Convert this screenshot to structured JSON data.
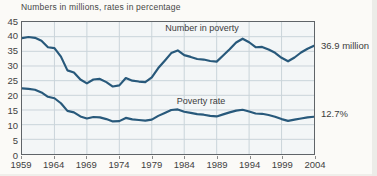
{
  "title": "Numbers in millions, rates in percentage",
  "annotations": {
    "number_series_label": "Number in poverty",
    "rate_series_label": "Poverty rate",
    "number_end_value": "36.9 million",
    "rate_end_value": "12.7%"
  },
  "colors": {
    "line": "#28597b",
    "grid": "#c9d3da",
    "plot_background": "#f3f6f7",
    "plot_border": "#5f6468",
    "text": "#3f3f3f"
  },
  "chart_data": {
    "type": "line",
    "title": "Numbers in millions, rates in percentage",
    "xlabel": "",
    "ylabel": "",
    "xlim": [
      1959,
      2004
    ],
    "ylim": [
      0,
      45
    ],
    "x_ticks": [
      1959,
      1964,
      1969,
      1974,
      1979,
      1984,
      1989,
      1994,
      1999,
      2004
    ],
    "y_ticks": [
      0,
      5,
      10,
      15,
      20,
      25,
      30,
      35,
      40,
      45
    ],
    "grid": true,
    "legend_position": "inline-annotations",
    "x": [
      1959,
      1960,
      1961,
      1962,
      1963,
      1964,
      1965,
      1966,
      1967,
      1968,
      1969,
      1970,
      1971,
      1972,
      1973,
      1974,
      1975,
      1976,
      1977,
      1978,
      1979,
      1980,
      1981,
      1982,
      1983,
      1984,
      1985,
      1986,
      1987,
      1988,
      1989,
      1990,
      1991,
      1992,
      1993,
      1994,
      1995,
      1996,
      1997,
      1998,
      1999,
      2000,
      2001,
      2002,
      2003,
      2004
    ],
    "series": [
      {
        "name": "Number in poverty",
        "unit": "millions",
        "end_label": "36.9 million",
        "values": [
          39.5,
          39.9,
          39.6,
          38.6,
          36.4,
          36.1,
          33.2,
          28.5,
          27.8,
          25.4,
          24.1,
          25.4,
          25.6,
          24.5,
          23.0,
          23.4,
          25.9,
          25.0,
          24.7,
          24.5,
          26.1,
          29.3,
          31.8,
          34.4,
          35.3,
          33.7,
          33.1,
          32.4,
          32.2,
          31.7,
          31.5,
          33.6,
          35.7,
          38.0,
          39.3,
          38.1,
          36.4,
          36.5,
          35.6,
          34.5,
          32.8,
          31.6,
          32.9,
          34.6,
          35.9,
          36.9
        ]
      },
      {
        "name": "Poverty rate",
        "unit": "percent",
        "end_label": "12.7%",
        "values": [
          22.4,
          22.2,
          21.9,
          21.0,
          19.5,
          19.0,
          17.3,
          14.7,
          14.2,
          12.8,
          12.1,
          12.6,
          12.5,
          11.9,
          11.1,
          11.2,
          12.3,
          11.8,
          11.6,
          11.4,
          11.7,
          13.0,
          14.0,
          15.0,
          15.2,
          14.4,
          14.0,
          13.6,
          13.4,
          13.0,
          12.8,
          13.5,
          14.2,
          14.8,
          15.1,
          14.5,
          13.8,
          13.7,
          13.3,
          12.7,
          11.9,
          11.3,
          11.7,
          12.1,
          12.5,
          12.7
        ]
      }
    ]
  }
}
